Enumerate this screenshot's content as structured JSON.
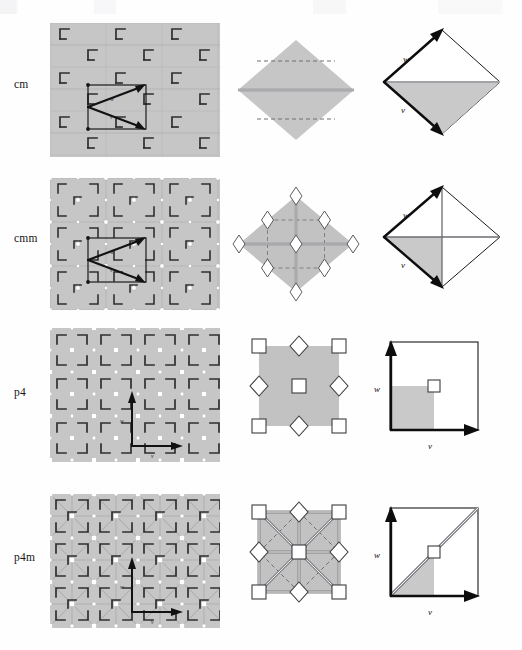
{
  "figure": {
    "background_color": "#fefefe",
    "width": 522,
    "height": 650,
    "columns": [
      "pattern",
      "cell",
      "lattice"
    ],
    "tile_fill": "#c6c6c6",
    "tile_fill_light": "#d2d2d2",
    "motif_color": "#2e2e2e",
    "center_marker_fill": "#ffffff",
    "center_marker_stroke": "#3a3a3a",
    "mirror_color": "#8c8c90",
    "vector_color": "#111111"
  },
  "rows": [
    {
      "id": "cm",
      "label": "cm",
      "label_y": 84,
      "pattern": {
        "name": "cm-pattern",
        "x": 50,
        "y": 23,
        "w": 170,
        "h": 134,
        "lattice_type": "centred rectangular",
        "motif": "L-shaped flag",
        "rotation_centers": [],
        "mirror_lines": "horizontal",
        "vectors_shown": [
          "w",
          "v"
        ]
      },
      "cell": {
        "name": "cm-cell",
        "x": 235,
        "y": 23,
        "w": 120,
        "h": 134,
        "shape": "rhombus",
        "solid_mirror_lines": 1,
        "dashed_glide_lines": 2,
        "markers": []
      },
      "lattice": {
        "name": "cm-lattice",
        "x": 365,
        "y": 23,
        "w": 140,
        "h": 134,
        "shape": "rhombus",
        "vector_labels": [
          "w",
          "v"
        ],
        "shaded_region": "lower half"
      }
    },
    {
      "id": "cmm",
      "label": "cmm",
      "label_y": 238,
      "pattern": {
        "name": "cmm-pattern",
        "x": 50,
        "y": 178,
        "w": 170,
        "h": 132,
        "lattice_type": "centred rectangular",
        "motif": "L-shaped flag",
        "rotation_centers": [
          "2-fold"
        ],
        "mirror_lines": "horizontal and vertical",
        "vectors_shown": [
          "w",
          "v"
        ]
      },
      "cell": {
        "name": "cmm-cell",
        "x": 235,
        "y": 178,
        "w": 120,
        "h": 132,
        "shape": "rhombus",
        "solid_mirror_lines": 2,
        "dashed_glide_lines": 4,
        "markers": [
          "diamond x9"
        ]
      },
      "lattice": {
        "name": "cmm-lattice",
        "x": 365,
        "y": 178,
        "w": 140,
        "h": 132,
        "shape": "rhombus",
        "vector_labels": [
          "w",
          "v"
        ],
        "shaded_region": "lower-left quarter"
      }
    },
    {
      "id": "p4",
      "label": "p4",
      "label_y": 392,
      "pattern": {
        "name": "p4-pattern",
        "x": 50,
        "y": 328,
        "w": 170,
        "h": 134,
        "lattice_type": "square",
        "motif": "L-shaped flag",
        "rotation_centers": [
          "4-fold",
          "2-fold"
        ],
        "mirror_lines": "none",
        "vectors_shown": [
          "w",
          "v"
        ]
      },
      "cell": {
        "name": "p4-cell",
        "x": 240,
        "y": 328,
        "w": 116,
        "h": 134,
        "shape": "square",
        "solid_mirror_lines": 0,
        "dashed_glide_lines": 0,
        "markers": [
          "square x5",
          "diamond x4"
        ]
      },
      "lattice": {
        "name": "p4-lattice",
        "x": 368,
        "y": 328,
        "w": 136,
        "h": 134,
        "shape": "square",
        "vector_labels": [
          "w",
          "v"
        ],
        "shaded_region": "lower-left quarter"
      }
    },
    {
      "id": "p4m",
      "label": "p4m",
      "label_y": 557,
      "pattern": {
        "name": "p4m-pattern",
        "x": 50,
        "y": 494,
        "w": 170,
        "h": 134,
        "lattice_type": "square",
        "motif": "L-shaped flag",
        "rotation_centers": [
          "4-fold",
          "2-fold"
        ],
        "mirror_lines": "horizontal, vertical and diagonal",
        "vectors_shown": [
          "w",
          "v"
        ]
      },
      "cell": {
        "name": "p4m-cell",
        "x": 240,
        "y": 494,
        "w": 116,
        "h": 134,
        "shape": "square",
        "solid_mirror_lines": 6,
        "dashed_glide_lines": 4,
        "markers": [
          "square x5",
          "diamond x4"
        ]
      },
      "lattice": {
        "name": "p4m-lattice",
        "x": 368,
        "y": 494,
        "w": 136,
        "h": 134,
        "shape": "square",
        "vector_labels": [
          "w",
          "v"
        ],
        "shaded_region": "lower triangle of lower-left quarter"
      }
    }
  ],
  "vector_labels": {
    "w": "w",
    "v": "v"
  }
}
